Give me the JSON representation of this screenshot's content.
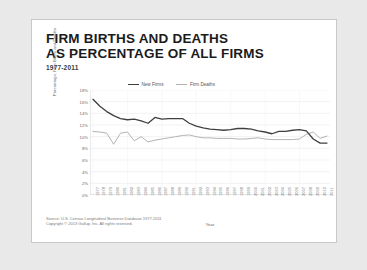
{
  "slide": {
    "title_line_1": "FIRM BIRTHS AND DEATHS",
    "title_line_2": "AS PERCENTAGE OF ALL FIRMS",
    "subtitle": "1977-2011"
  },
  "footer": {
    "source": "Source: U.S. Census Longitudinal Business Database 1977-2011",
    "copyright": "Copyright © 2013 Gallup, Inc. All rights reserved."
  },
  "colors": {
    "new_firms": "#3f3f3f",
    "firm_deaths": "#b3b3b3",
    "grid": "#e4e4e4",
    "axis": "#bdbdbd",
    "card": "#ffffff",
    "background": "#e9e9e9"
  },
  "chart_data": {
    "type": "line",
    "title": "FIRM BIRTHS AND DEATHS AS PERCENTAGE OF ALL FIRMS",
    "subtitle": "1977-2011",
    "xlabel": "Year",
    "ylabel": "Percentage, Firm Births and Deaths",
    "ylim": [
      0,
      18
    ],
    "yticks": [
      0,
      2,
      4,
      6,
      8,
      10,
      12,
      14,
      16,
      18
    ],
    "ytick_labels": [
      "0%",
      "2%",
      "4%",
      "6%",
      "8%",
      "10%",
      "12%",
      "14%",
      "16%",
      "18%"
    ],
    "grid": true,
    "legend_position": "top-center",
    "x": [
      1977,
      1978,
      1979,
      1980,
      1981,
      1982,
      1983,
      1984,
      1985,
      1986,
      1987,
      1988,
      1989,
      1990,
      1991,
      1992,
      1993,
      1994,
      1995,
      1996,
      1997,
      1998,
      1999,
      2000,
      2001,
      2002,
      2003,
      2004,
      2005,
      2006,
      2007,
      2008,
      2009,
      2010,
      2011
    ],
    "xtick_labels": [
      "1977",
      "1978",
      "1979",
      "1980",
      "1981",
      "1982",
      "1983",
      "1984",
      "1985",
      "1986",
      "1987",
      "1988",
      "1989",
      "1990",
      "1991",
      "1992",
      "1993",
      "1994",
      "1995",
      "1996",
      "1997",
      "1998",
      "1999",
      "2000",
      "2001",
      "2002",
      "2003",
      "2004",
      "2005",
      "2006",
      "2007",
      "2008",
      "2009",
      "2010",
      "2011"
    ],
    "series": [
      {
        "name": "New Firms",
        "color": "#3f3f3f",
        "values": [
          16.4,
          15.2,
          14.3,
          13.6,
          13.1,
          12.9,
          13.0,
          12.7,
          12.3,
          13.3,
          13.0,
          13.1,
          13.1,
          13.1,
          12.3,
          11.8,
          11.5,
          11.3,
          11.2,
          11.1,
          11.2,
          11.4,
          11.4,
          11.3,
          11.0,
          10.8,
          10.5,
          10.9,
          10.9,
          11.1,
          11.2,
          11.0,
          9.6,
          8.9,
          8.9
        ]
      },
      {
        "name": "Firm Deaths",
        "color": "#b3b3b3",
        "values": [
          10.9,
          10.8,
          10.6,
          8.7,
          10.6,
          10.8,
          9.3,
          10.0,
          9.1,
          9.4,
          9.6,
          9.8,
          10.0,
          10.2,
          10.3,
          10.0,
          9.8,
          9.8,
          9.7,
          9.7,
          9.7,
          9.6,
          9.6,
          9.7,
          9.8,
          9.6,
          9.5,
          9.5,
          9.5,
          9.5,
          9.6,
          10.4,
          10.8,
          9.7,
          10.1
        ]
      }
    ]
  }
}
